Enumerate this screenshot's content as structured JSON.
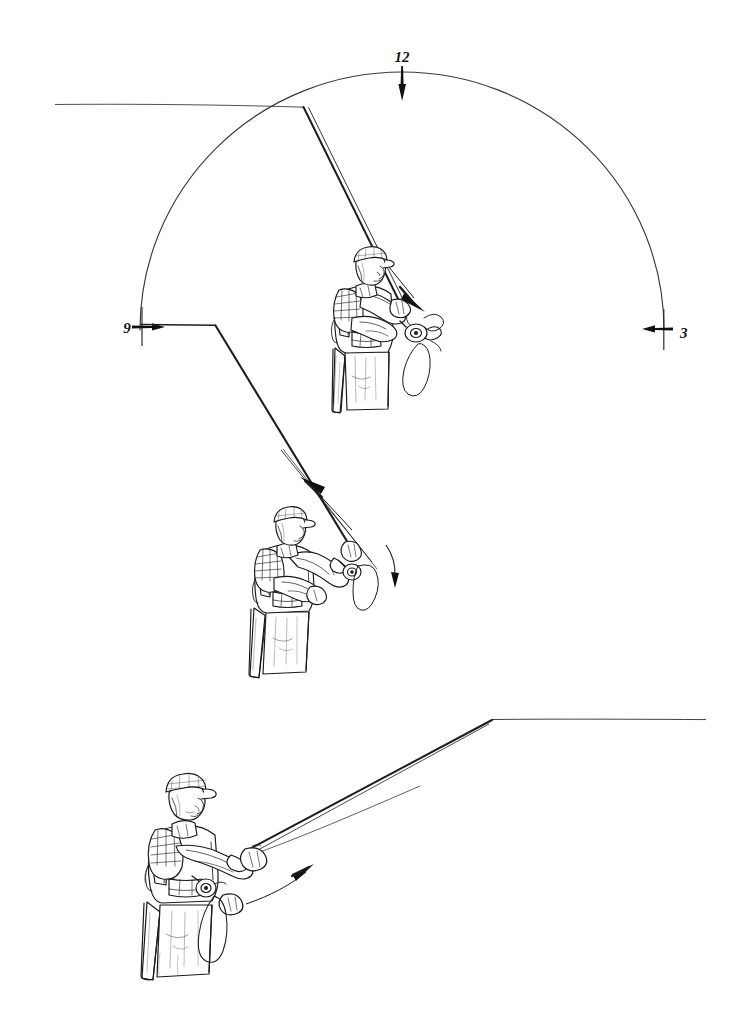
{
  "figure": {
    "medium": "pen-and-ink line drawing",
    "background_color": "#ffffff",
    "ink_color": "#1a1a1a",
    "panel_count": 3
  },
  "clock_markers": [
    {
      "id": "twelve",
      "label": "12",
      "angle_deg": 90,
      "label_x": 402,
      "label_y": 58,
      "tick_x": 402,
      "tick_y1": 70,
      "tick_y2": 100,
      "arrow": "down",
      "description": "top of the casting arc"
    },
    {
      "id": "nine",
      "label": "9",
      "angle_deg": 180,
      "label_x": 122,
      "label_y": 332,
      "tick_x": 141,
      "tick_y1": 308,
      "tick_y2": 345,
      "arrow": "right",
      "description": "rod tip back position, left of caster"
    },
    {
      "id": "three",
      "label": "3",
      "angle_deg": 0,
      "label_x": 681,
      "label_y": 337,
      "tick_x": 663,
      "tick_y1": 310,
      "tick_y2": 348,
      "arrow": "left",
      "description": "rod tip forward position, right of caster"
    }
  ],
  "arc": {
    "name": "casting-arc",
    "center_x": 402,
    "center_y": 330,
    "radius_x": 262,
    "radius_y": 258,
    "start_deg": 180,
    "end_deg": 0,
    "stroke": "#3a3a3a",
    "stroke_width": 1.1,
    "description": "semicircular clock face through which the rod tip travels"
  },
  "panels": [
    {
      "id": "panel-top",
      "order": 1,
      "name": "stop-at-twelve",
      "caption": "",
      "figure_pose": "caster stopped with rod near vertical, line straightening behind",
      "line_vertex": {
        "x": 303,
        "y": 107
      },
      "line_tail": {
        "x": 55,
        "y": 104
      },
      "rod_butt": {
        "x": 405,
        "y": 313
      },
      "arrow": {
        "id": "arrow-top",
        "direction": "down-right",
        "from_x": 377,
        "from_y": 252,
        "to_x": 425,
        "to_y": 312
      }
    },
    {
      "id": "panel-middle",
      "order": 2,
      "name": "back-cast-at-nine",
      "caption": "",
      "figure_pose": "caster with rod angled back, line extending up and to the left",
      "line_vertex": {
        "x": 215,
        "y": 325
      },
      "line_tail": {
        "x": 141,
        "y": 324
      },
      "rod_butt": {
        "x": 356,
        "y": 555
      },
      "arrow": {
        "id": "arrow-middle",
        "direction": "up-left",
        "from_x": 348,
        "from_y": 522,
        "to_x": 301,
        "to_y": 478
      }
    },
    {
      "id": "panel-bottom",
      "order": 3,
      "name": "forward-delivery",
      "caption": "",
      "figure_pose": "caster presenting forward, rod low and line unrolling to the right",
      "line_vertex": {
        "x": 492,
        "y": 720
      },
      "line_tail": {
        "x": 706,
        "y": 719
      },
      "rod_butt": {
        "x": 243,
        "y": 851
      },
      "arrow": {
        "id": "arrow-bottom",
        "direction": "up-right",
        "from_x": 249,
        "from_y": 902,
        "to_x": 311,
        "to_y": 866
      }
    }
  ],
  "figure_parts": [
    "billed-cap",
    "face-in-profile",
    "plaid-shirt",
    "fishing-vest",
    "waders",
    "gripping-hand",
    "fly-reel",
    "slack-line-loop",
    "fly-rod"
  ]
}
